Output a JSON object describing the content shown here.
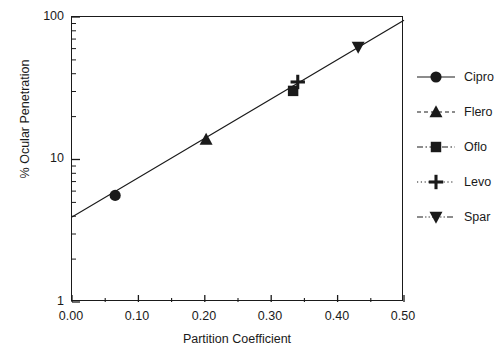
{
  "chart_data": {
    "type": "scatter",
    "title": "",
    "xlabel": "Partition Coefficient",
    "ylabel": "% Ocular Penetration",
    "xlim": [
      0.0,
      0.5
    ],
    "ylim": [
      1,
      100
    ],
    "yscale": "log",
    "xscale": "linear",
    "grid": false,
    "legend_position": "right",
    "xticks": [
      "0.00",
      "0.10",
      "0.20",
      "0.30",
      "0.40",
      "0.50"
    ],
    "xtick_values": [
      0.0,
      0.1,
      0.2,
      0.3,
      0.4,
      0.5
    ],
    "xminor_tick_values": [
      0.05,
      0.15,
      0.25,
      0.35,
      0.45
    ],
    "yticks": [
      "1",
      "10",
      "100"
    ],
    "ytick_values": [
      1,
      10,
      100
    ],
    "series": [
      {
        "name": "Cipro",
        "marker": "circle",
        "linestyle": "solid",
        "x": 0.065,
        "y": 5.6
      },
      {
        "name": "Flero",
        "marker": "triangle-up",
        "linestyle": "dashed",
        "x": 0.202,
        "y": 13.8
      },
      {
        "name": "Oflo",
        "marker": "square",
        "linestyle": "dash-dot",
        "x": 0.333,
        "y": 30.3
      },
      {
        "name": "Levo",
        "marker": "plus",
        "linestyle": "dotted",
        "x": 0.34,
        "y": 35.0
      },
      {
        "name": "Spar",
        "marker": "triangle-down",
        "linestyle": "dash-dot-dot",
        "x": 0.431,
        "y": 61.5
      }
    ],
    "trendline": {
      "x": [
        0.0,
        0.5
      ],
      "y": [
        3.95,
        95.0
      ]
    },
    "colors": {
      "foreground": "#1a1a1a",
      "background": "#ffffff"
    }
  },
  "legend": {
    "items": [
      {
        "label": "Cipro"
      },
      {
        "label": "Flero"
      },
      {
        "label": "Oflo"
      },
      {
        "label": "Levo"
      },
      {
        "label": "Spar"
      }
    ]
  }
}
